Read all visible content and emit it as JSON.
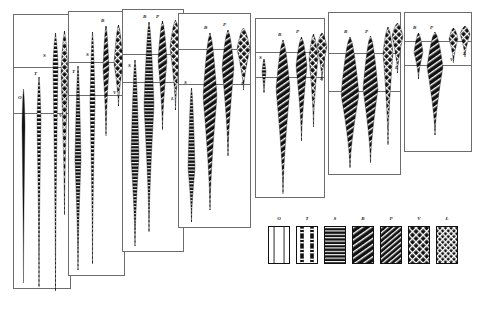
{
  "figure": {
    "caption": "",
    "background_color": "#ffffff",
    "line_color": "#6d6d6d",
    "fill_color": "#111111"
  },
  "panels": [
    {
      "name": "panel-1",
      "x": 13,
      "y": 14,
      "w": 58,
      "h": 275,
      "dividers": [
        52,
        98
      ],
      "spindles": [
        {
          "name": "spindle-o",
          "label": "O",
          "label_x": 4,
          "label_y": 80,
          "cx": 9,
          "top": 74,
          "bottom": 268,
          "max_w": 3,
          "peak": 0.18,
          "pattern": "solid-thin",
          "tip": "none"
        },
        {
          "name": "spindle-t",
          "label": "T",
          "label_x": 20,
          "label_y": 56,
          "cx": 25,
          "top": 62,
          "bottom": 272,
          "max_w": 4,
          "peak": 0.2,
          "pattern": "dashed",
          "tip": "dash"
        },
        {
          "name": "spindle-s",
          "label": "S",
          "label_x": 29,
          "label_y": 38,
          "cx": 41,
          "top": 18,
          "bottom": 276,
          "max_w": 5,
          "peak": 0.12,
          "pattern": "dashed",
          "tip": "dash"
        },
        {
          "name": "spindle-v",
          "label": "V",
          "label_x": 45,
          "label_y": 98,
          "cx": 50,
          "top": 16,
          "bottom": 200,
          "max_w": 7,
          "peak": 0.22,
          "pattern": "cross",
          "tip": "dash"
        }
      ]
    },
    {
      "name": "panel-2",
      "x": 68,
      "y": 11,
      "w": 57,
      "h": 265,
      "dividers": [
        50,
        83
      ],
      "spindles": [
        {
          "name": "spindle-t",
          "label": "T",
          "label_x": 3,
          "label_y": 57,
          "cx": 9,
          "top": 54,
          "bottom": 258,
          "max_w": 6,
          "peak": 0.46,
          "pattern": "bars",
          "tip": "dash"
        },
        {
          "name": "spindle-s",
          "label": "S",
          "label_x": 17,
          "label_y": 40,
          "cx": 23,
          "top": 20,
          "bottom": 252,
          "max_w": 5,
          "peak": 0.3,
          "pattern": "dashed",
          "tip": "dash"
        },
        {
          "name": "spindle-b",
          "label": "B",
          "label_x": 32,
          "label_y": 6,
          "cx": 37,
          "top": 14,
          "bottom": 124,
          "max_w": 6,
          "peak": 0.38,
          "pattern": "diag",
          "tip": "dash"
        },
        {
          "name": "spindle-v",
          "label": "V",
          "label_x": 44,
          "label_y": 78,
          "cx": 49,
          "top": 13,
          "bottom": 94,
          "max_w": 9,
          "peak": 0.48,
          "pattern": "cross",
          "tip": "dash"
        }
      ]
    },
    {
      "name": "panel-3",
      "x": 122,
      "y": 9,
      "w": 62,
      "h": 243,
      "dividers": [
        44,
        72
      ],
      "spindles": [
        {
          "name": "spindle-s",
          "label": "S",
          "label_x": 5,
          "label_y": 53,
          "cx": 12,
          "top": 50,
          "bottom": 236,
          "max_w": 8,
          "peak": 0.52,
          "pattern": "bars",
          "tip": "dash"
        },
        {
          "name": "spindle-b",
          "label": "B",
          "label_x": 20,
          "label_y": 4,
          "cx": 26,
          "top": 12,
          "bottom": 222,
          "max_w": 10,
          "peak": 0.4,
          "pattern": "bars",
          "tip": "dash"
        },
        {
          "name": "spindle-p",
          "label": "P",
          "label_x": 33,
          "label_y": 4,
          "cx": 39,
          "top": 11,
          "bottom": 120,
          "max_w": 9,
          "peak": 0.36,
          "pattern": "diag",
          "tip": "dash"
        },
        {
          "name": "spindle-l",
          "label": "L",
          "label_x": 48,
          "label_y": 86,
          "cx": 52,
          "top": 10,
          "bottom": 100,
          "max_w": 11,
          "peak": 0.3,
          "pattern": "cross",
          "tip": "dash"
        }
      ]
    },
    {
      "name": "panel-4",
      "x": 178,
      "y": 13,
      "w": 73,
      "h": 215,
      "dividers": [
        35,
        70
      ],
      "spindles": [
        {
          "name": "spindle-s",
          "label": "S",
          "label_x": 5,
          "label_y": 66,
          "cx": 12,
          "top": 74,
          "bottom": 208,
          "max_w": 7,
          "peak": 0.6,
          "pattern": "bars",
          "tip": "dash"
        },
        {
          "name": "spindle-b",
          "label": "B",
          "label_x": 25,
          "label_y": 11,
          "cx": 31,
          "top": 19,
          "bottom": 196,
          "max_w": 14,
          "peak": 0.36,
          "pattern": "diag",
          "tip": "dash"
        },
        {
          "name": "spindle-p",
          "label": "P",
          "label_x": 44,
          "label_y": 8,
          "cx": 49,
          "top": 16,
          "bottom": 142,
          "max_w": 12,
          "peak": 0.3,
          "pattern": "diag",
          "tip": "dash"
        },
        {
          "name": "spindle-l",
          "label": "L",
          "label_x": 62,
          "label_y": 67,
          "cx": 64,
          "top": 14,
          "bottom": 76,
          "max_w": 13,
          "peak": 0.34,
          "pattern": "cross",
          "tip": "dash"
        }
      ]
    },
    {
      "name": "panel-5",
      "x": 255,
      "y": 18,
      "w": 70,
      "h": 180,
      "dividers": [
        33,
        58
      ],
      "spindles": [
        {
          "name": "spindle-s",
          "label": "S",
          "label_x": 3,
          "label_y": 36,
          "cx": 8,
          "top": 40,
          "bottom": 74,
          "max_w": 4,
          "peak": 0.4,
          "pattern": "bars",
          "tip": "dash"
        },
        {
          "name": "spindle-b",
          "label": "B",
          "label_x": 22,
          "label_y": 13,
          "cx": 27,
          "top": 21,
          "bottom": 175,
          "max_w": 14,
          "peak": 0.32,
          "pattern": "diag",
          "tip": "dash"
        },
        {
          "name": "spindle-p",
          "label": "P",
          "label_x": 40,
          "label_y": 10,
          "cx": 45,
          "top": 18,
          "bottom": 122,
          "max_w": 11,
          "peak": 0.28,
          "pattern": "diag",
          "tip": "dash"
        },
        {
          "name": "spindle-v",
          "label": "V",
          "label_x": 54,
          "label_y": 48,
          "cx": 57,
          "top": 15,
          "bottom": 108,
          "max_w": 9,
          "peak": 0.26,
          "pattern": "cross",
          "tip": "dash"
        },
        {
          "name": "spindle-l",
          "label": "L",
          "label_x": 64,
          "label_y": 57,
          "cx": 66,
          "top": 14,
          "bottom": 62,
          "max_w": 10,
          "peak": 0.28,
          "pattern": "cross",
          "tip": "dash"
        }
      ]
    },
    {
      "name": "panel-6",
      "x": 328,
      "y": 12,
      "w": 73,
      "h": 163,
      "dividers": [
        40,
        78
      ],
      "spindles": [
        {
          "name": "spindle-b",
          "label": "B",
          "label_x": 15,
          "label_y": 16,
          "cx": 21,
          "top": 24,
          "bottom": 155,
          "max_w": 18,
          "peak": 0.44,
          "pattern": "diag",
          "tip": "dash"
        },
        {
          "name": "spindle-p",
          "label": "P",
          "label_x": 36,
          "label_y": 16,
          "cx": 41,
          "top": 23,
          "bottom": 150,
          "max_w": 15,
          "peak": 0.42,
          "pattern": "diag",
          "tip": "dash"
        },
        {
          "name": "spindle-v",
          "label": "V",
          "label_x": 56,
          "label_y": 70,
          "cx": 59,
          "top": 14,
          "bottom": 132,
          "max_w": 10,
          "peak": 0.22,
          "pattern": "cross",
          "tip": "dash"
        },
        {
          "name": "spindle-l",
          "label": "L",
          "label_x": 66,
          "label_y": 52,
          "cx": 68,
          "top": 10,
          "bottom": 60,
          "max_w": 11,
          "peak": 0.26,
          "pattern": "cross",
          "tip": "dash"
        }
      ]
    },
    {
      "name": "panel-7",
      "x": 404,
      "y": 12,
      "w": 68,
      "h": 140,
      "dividers": [
        28,
        52
      ],
      "spindles": [
        {
          "name": "spindle-b",
          "label": "B",
          "label_x": 8,
          "label_y": 12,
          "cx": 13,
          "top": 20,
          "bottom": 66,
          "max_w": 9,
          "peak": 0.42,
          "pattern": "diag",
          "tip": "dash"
        },
        {
          "name": "spindle-p",
          "label": "P",
          "label_x": 25,
          "label_y": 12,
          "cx": 30,
          "top": 19,
          "bottom": 122,
          "max_w": 16,
          "peak": 0.34,
          "pattern": "diag",
          "tip": "dash"
        },
        {
          "name": "spindle-v",
          "label": "V",
          "label_x": 45,
          "label_y": 44,
          "cx": 48,
          "top": 15,
          "bottom": 50,
          "max_w": 9,
          "peak": 0.3,
          "pattern": "cross",
          "tip": "dash"
        },
        {
          "name": "spindle-l",
          "label": "L",
          "label_x": 58,
          "label_y": 38,
          "cx": 60,
          "top": 13,
          "bottom": 44,
          "max_w": 10,
          "peak": 0.26,
          "pattern": "cross",
          "tip": "dash"
        }
      ]
    }
  ],
  "legend": {
    "name": "pattern-legend",
    "items": [
      {
        "label": "O",
        "pattern": "open",
        "x": 0
      },
      {
        "label": "T",
        "pattern": "tblock",
        "x": 28
      },
      {
        "label": "S",
        "pattern": "bars",
        "x": 56
      },
      {
        "label": "B",
        "pattern": "diag",
        "x": 84
      },
      {
        "label": "P",
        "pattern": "diag2",
        "x": 112
      },
      {
        "label": "V",
        "pattern": "cross",
        "x": 140
      },
      {
        "label": "L",
        "pattern": "cross2",
        "x": 168
      }
    ]
  },
  "chart_data": {
    "type": "area",
    "xlabel": "",
    "ylabel": "",
    "legend_position": "bottom-right",
    "grid": false,
    "taxa": [
      "O",
      "T",
      "S",
      "B",
      "P",
      "V",
      "L"
    ],
    "panels": [
      "panel-1",
      "panel-2",
      "panel-3",
      "panel-4",
      "panel-5",
      "panel-6",
      "panel-7"
    ],
    "series": [
      {
        "name": "O",
        "values": [
          0.18,
          0.0,
          0.0,
          0.0,
          0.0,
          0.0,
          0.0
        ]
      },
      {
        "name": "T",
        "values": [
          0.2,
          0.46,
          0.0,
          0.0,
          0.0,
          0.0,
          0.0
        ]
      },
      {
        "name": "S",
        "values": [
          0.12,
          0.3,
          0.52,
          0.6,
          0.4,
          0.0,
          0.0
        ]
      },
      {
        "name": "B",
        "values": [
          0.0,
          0.38,
          0.4,
          0.36,
          0.32,
          0.44,
          0.42
        ]
      },
      {
        "name": "P",
        "values": [
          0.0,
          0.0,
          0.36,
          0.3,
          0.28,
          0.42,
          0.34
        ]
      },
      {
        "name": "V",
        "values": [
          0.22,
          0.48,
          0.0,
          0.0,
          0.26,
          0.22,
          0.3
        ]
      },
      {
        "name": "L",
        "values": [
          0.0,
          0.0,
          0.3,
          0.34,
          0.28,
          0.26,
          0.26
        ]
      }
    ]
  }
}
